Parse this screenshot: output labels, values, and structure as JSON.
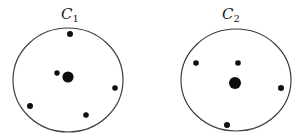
{
  "page": {
    "width": 305,
    "height": 137,
    "background_color": "#ffffff"
  },
  "diagram": {
    "type": "point-set-circles",
    "stroke_color": "#3d3d3d",
    "dot_color": "#0e0e0e",
    "label_color": "#1a1a1a",
    "circles": [
      {
        "id": "C1",
        "label": "C",
        "label_sub": "1",
        "label_x": 70,
        "label_y": 19,
        "cx": 68,
        "cy": 80,
        "rx": 55,
        "ry": 52,
        "dots": [
          {
            "x": 70,
            "y": 34,
            "r": 3,
            "size": "small"
          },
          {
            "x": 57,
            "y": 73,
            "r": 2.7,
            "size": "small"
          },
          {
            "x": 68,
            "y": 77,
            "r": 5.6,
            "size": "large"
          },
          {
            "x": 115,
            "y": 88,
            "r": 2.8,
            "size": "small"
          },
          {
            "x": 30,
            "y": 106,
            "r": 3,
            "size": "small"
          },
          {
            "x": 86,
            "y": 115,
            "r": 2.8,
            "size": "small"
          }
        ]
      },
      {
        "id": "C2",
        "label": "C",
        "label_sub": "2",
        "label_x": 231,
        "label_y": 19,
        "cx": 236,
        "cy": 80,
        "rx": 55,
        "ry": 51,
        "dots": [
          {
            "x": 196,
            "y": 63,
            "r": 2.8,
            "size": "small"
          },
          {
            "x": 238,
            "y": 63,
            "r": 2.8,
            "size": "small"
          },
          {
            "x": 235,
            "y": 83,
            "r": 6,
            "size": "large"
          },
          {
            "x": 281,
            "y": 88,
            "r": 3,
            "size": "small"
          },
          {
            "x": 227,
            "y": 125,
            "r": 3,
            "size": "small"
          }
        ]
      }
    ]
  }
}
